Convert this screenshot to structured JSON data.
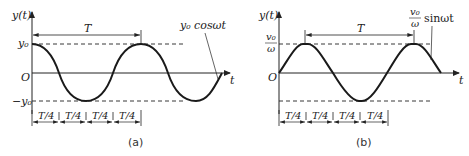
{
  "figures": [
    {
      "id": "a",
      "caption": "(a)",
      "y_axis_label": "y(t)",
      "x_axis_label": "t",
      "origin_label": "O",
      "upper_level_label": "y₀",
      "lower_level_label": "−y₀",
      "period_label": "T",
      "quarter_labels": [
        "T/4",
        "T/4",
        "T/4",
        "T/4"
      ],
      "curve_label": "y₀ cosωt",
      "function": "cos"
    },
    {
      "id": "b",
      "caption": "(b)",
      "y_axis_label": "y(t)",
      "x_axis_label": "t",
      "origin_label": "O",
      "upper_level_label_num": "v₀",
      "upper_level_label_den": "ω",
      "period_label": "T",
      "quarter_labels": [
        "T/4",
        "T/4",
        "T/4",
        "T/4"
      ],
      "curve_label_num": "v₀",
      "curve_label_den": "ω",
      "curve_label_fn": "sinωt",
      "function": "sin"
    }
  ],
  "colors": {
    "ink": "#222222",
    "curve": "#1a1a1a"
  }
}
